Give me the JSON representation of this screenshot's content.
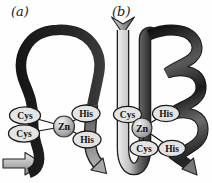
{
  "panel_a": {
    "label": "(a)",
    "nodes": {
      "cys_top": "Cys",
      "cys_bottom": "Cys",
      "zn": "Zn",
      "his_top": "His",
      "his_bottom": "His"
    }
  },
  "panel_b": {
    "label": "(b)",
    "nodes": {
      "cys_top": "Cys",
      "cys_bottom": "Cys",
      "zn": "Zn",
      "his_top": "His",
      "his_bottom": "His"
    }
  },
  "colors": {
    "background": "#fefefe",
    "ribbon_dark": "#242424",
    "ribbon_gray": "#9e9e9e",
    "ribbon_light": "#e6e6e6",
    "node_fill": "#e4e4e4",
    "node_outline": "#1c1c1c",
    "bond": "#141414",
    "text": "#101010"
  }
}
